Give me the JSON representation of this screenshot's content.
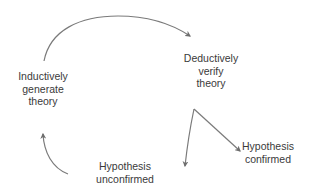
{
  "diagram": {
    "type": "cycle-flow",
    "nodes": [
      {
        "id": "induct",
        "lines": [
          "Inductively",
          "generate",
          "theory"
        ]
      },
      {
        "id": "deduct",
        "lines": [
          "Deductively",
          "verify",
          "theory"
        ]
      },
      {
        "id": "confirmed",
        "lines": [
          "Hypothesis",
          "confirmed"
        ]
      },
      {
        "id": "unconfirmed",
        "lines": [
          "Hypothesis",
          "unconfirmed"
        ]
      }
    ],
    "edges": [
      {
        "from": "induct",
        "to": "deduct"
      },
      {
        "from": "deduct",
        "to": "confirmed"
      },
      {
        "from": "deduct",
        "to": "unconfirmed"
      },
      {
        "from": "unconfirmed",
        "to": "induct"
      }
    ],
    "colors": {
      "arrow": "#6e6e6e",
      "text": "#3a3a3a",
      "background": "#ffffff"
    }
  }
}
